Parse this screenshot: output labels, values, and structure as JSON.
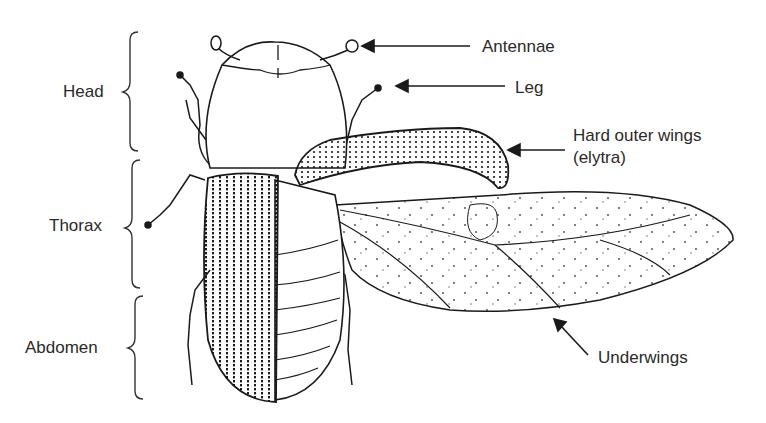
{
  "diagram": {
    "segments": [
      {
        "id": "head",
        "label": "Head"
      },
      {
        "id": "thorax",
        "label": "Thorax"
      },
      {
        "id": "abdomen",
        "label": "Abdomen"
      }
    ],
    "callouts": [
      {
        "id": "antennae",
        "label": "Antennae"
      },
      {
        "id": "leg",
        "label": "Leg"
      },
      {
        "id": "elytra",
        "label_line1": "Hard outer wings",
        "label_line2": "(elytra)"
      },
      {
        "id": "underwings",
        "label": "Underwings"
      }
    ],
    "colors": {
      "ink": "#1a1a1a",
      "text": "#2a2a2a",
      "background": "#ffffff"
    }
  }
}
